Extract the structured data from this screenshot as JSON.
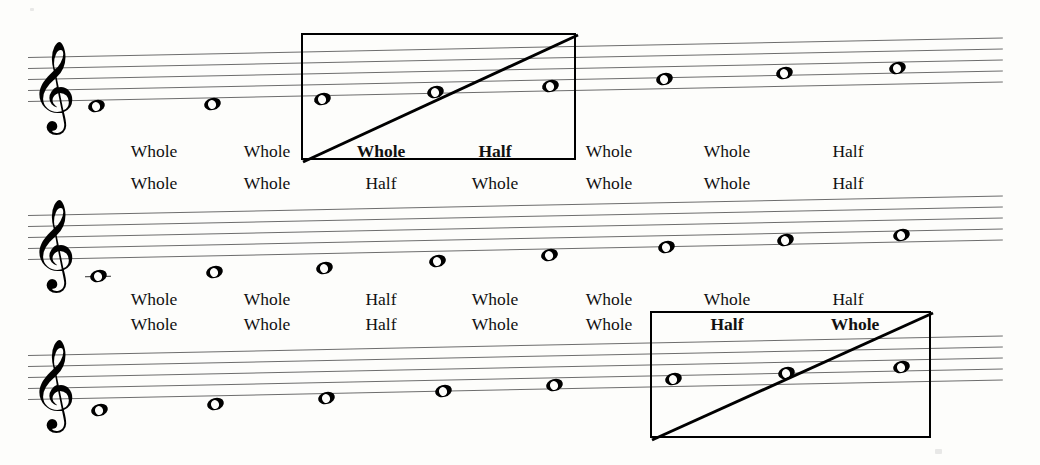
{
  "document": {
    "title": "Major Scale Whole and Half Step Pattern",
    "page_background": "#fdfdfb",
    "ink_color": "#111111",
    "staff_line_color": "#6d6d6d"
  },
  "systems": [
    {
      "id": "system-1",
      "clef": "treble-clef",
      "clef_glyph": "𝄞",
      "notes": [
        {
          "x": 96,
          "y": 100,
          "ledger": false
        },
        {
          "x": 212,
          "y": 98,
          "ledger": false
        },
        {
          "x": 322,
          "y": 93,
          "ledger": false
        },
        {
          "x": 435,
          "y": 86,
          "ledger": false
        },
        {
          "x": 550,
          "y": 80,
          "ledger": false
        },
        {
          "x": 664,
          "y": 73,
          "ledger": false
        },
        {
          "x": 784,
          "y": 67,
          "ledger": false
        },
        {
          "x": 897,
          "y": 62,
          "ledger": false
        }
      ],
      "label_rows": [
        {
          "id": "row-1-upper",
          "y": 140,
          "labels": [
            {
              "text": "Whole",
              "x": 154,
              "bold": false
            },
            {
              "text": "Whole",
              "x": 267,
              "bold": false
            },
            {
              "text": "Whole",
              "x": 381,
              "bold": true
            },
            {
              "text": "Half",
              "x": 495,
              "bold": true
            },
            {
              "text": "Whole",
              "x": 609,
              "bold": false
            },
            {
              "text": "Whole",
              "x": 727,
              "bold": false
            },
            {
              "text": "Half",
              "x": 848,
              "bold": false
            }
          ]
        },
        {
          "id": "row-1-lower",
          "y": 172,
          "labels": [
            {
              "text": "Whole",
              "x": 154,
              "bold": false
            },
            {
              "text": "Whole",
              "x": 267,
              "bold": false
            },
            {
              "text": "Half",
              "x": 381,
              "bold": false
            },
            {
              "text": "Whole",
              "x": 495,
              "bold": false
            },
            {
              "text": "Whole",
              "x": 609,
              "bold": false
            },
            {
              "text": "Whole",
              "x": 727,
              "bold": false
            },
            {
              "text": "Half",
              "x": 848,
              "bold": false
            }
          ]
        }
      ],
      "highlight_box": {
        "id": "highlight-box-1",
        "x": 301,
        "y": 33,
        "width": 275,
        "height": 127,
        "diagonal": "bottom-left-to-top-right"
      }
    },
    {
      "id": "system-2",
      "clef": "treble-clef",
      "clef_glyph": "𝄞",
      "notes": [
        {
          "x": 98,
          "y": 270,
          "ledger": true
        },
        {
          "x": 214,
          "y": 266,
          "ledger": false
        },
        {
          "x": 324,
          "y": 262,
          "ledger": false
        },
        {
          "x": 437,
          "y": 255,
          "ledger": false
        },
        {
          "x": 549,
          "y": 249,
          "ledger": false
        },
        {
          "x": 666,
          "y": 241,
          "ledger": false
        },
        {
          "x": 785,
          "y": 234,
          "ledger": false
        },
        {
          "x": 901,
          "y": 229,
          "ledger": false
        }
      ],
      "label_rows": [
        {
          "id": "row-2-upper",
          "y": 288,
          "labels": [
            {
              "text": "Whole",
              "x": 154,
              "bold": false
            },
            {
              "text": "Whole",
              "x": 267,
              "bold": false
            },
            {
              "text": "Half",
              "x": 381,
              "bold": false
            },
            {
              "text": "Whole",
              "x": 495,
              "bold": false
            },
            {
              "text": "Whole",
              "x": 609,
              "bold": false
            },
            {
              "text": "Whole",
              "x": 727,
              "bold": false
            },
            {
              "text": "Half",
              "x": 848,
              "bold": false
            }
          ]
        },
        {
          "id": "row-2-lower",
          "y": 313,
          "labels": [
            {
              "text": "Whole",
              "x": 154,
              "bold": false
            },
            {
              "text": "Whole",
              "x": 267,
              "bold": false
            },
            {
              "text": "Half",
              "x": 381,
              "bold": false
            },
            {
              "text": "Whole",
              "x": 495,
              "bold": false
            },
            {
              "text": "Whole",
              "x": 609,
              "bold": false
            },
            {
              "text": "Half",
              "x": 727,
              "bold": true
            },
            {
              "text": "Whole",
              "x": 855,
              "bold": true
            }
          ]
        }
      ],
      "highlight_box": null
    },
    {
      "id": "system-3",
      "clef": "treble-clef",
      "clef_glyph": "𝄞",
      "notes": [
        {
          "x": 99,
          "y": 404,
          "ledger": false
        },
        {
          "x": 215,
          "y": 398,
          "ledger": false
        },
        {
          "x": 326,
          "y": 392,
          "ledger": false
        },
        {
          "x": 443,
          "y": 385,
          "ledger": false
        },
        {
          "x": 554,
          "y": 379,
          "ledger": false
        },
        {
          "x": 673,
          "y": 373,
          "ledger": false
        },
        {
          "x": 786,
          "y": 367,
          "ledger": false
        },
        {
          "x": 901,
          "y": 361,
          "ledger": false
        }
      ],
      "label_rows": [],
      "highlight_box": {
        "id": "highlight-box-3",
        "x": 650,
        "y": 311,
        "width": 281,
        "height": 127,
        "diagonal": "bottom-left-to-top-right"
      }
    }
  ],
  "staff_geometry": {
    "system_1": {
      "top_y": 57,
      "line_gap": 11,
      "tilt_deg": -1.15,
      "clef_x": 30,
      "clef_y": 46
    },
    "system_2": {
      "top_y": 215,
      "line_gap": 11,
      "tilt_deg": -1.15,
      "clef_x": 30,
      "clef_y": 204
    },
    "system_3": {
      "top_y": 355,
      "line_gap": 11,
      "tilt_deg": -1.15,
      "clef_x": 30,
      "clef_y": 344
    }
  }
}
